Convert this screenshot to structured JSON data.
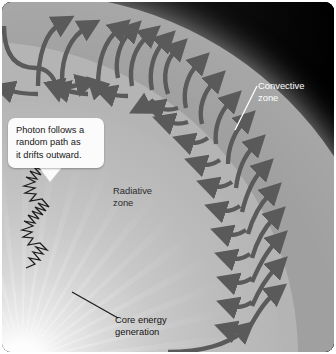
{
  "figure": {
    "background_color": "#000000",
    "frame_corner_radius_px": 9
  },
  "callout": {
    "name": "photon-random-walk-callout",
    "line1": "Photon follows a",
    "line2": "random path as",
    "line3": "it drifts outward.",
    "text": "Photon follows a random path as it drifts outward.",
    "background_color": "#fbfbfb",
    "text_color": "#171717"
  },
  "labels": {
    "convective": {
      "line1": "Convective",
      "line2": "zone",
      "text": "Convective zone",
      "color": "#ffffff",
      "leader": "white line pointing down-left to convective band"
    },
    "radiative": {
      "line1": "Radiative",
      "line2": "zone",
      "text": "Radiative zone",
      "color": "#2b2b2b",
      "leader": "none"
    },
    "core": {
      "line1": "Core energy",
      "line2": "generation",
      "text": "Core energy generation",
      "color": "#111111",
      "leader": "dark line pointing up-left to bright core"
    }
  },
  "zones": [
    {
      "name": "core",
      "label": "Core energy generation",
      "color": "#ffffff",
      "description": "bright white radiating point source at lower left"
    },
    {
      "name": "radiative-zone",
      "label": "Radiative zone",
      "color": "#b4b4b4",
      "description": "light gray interior region where photons random-walk"
    },
    {
      "name": "convective-zone",
      "label": "Convective zone",
      "color": "#a0a0a0",
      "description": "gray outer annulus containing curved convection flow arrows"
    },
    {
      "name": "space",
      "label": "",
      "color": "#000000",
      "description": "black background outside the star limb"
    }
  ],
  "photon_path": {
    "name": "photon-random-walk",
    "stroke_color": "#1c1c1c",
    "arrowhead": "up-right",
    "description": "dense zigzag random walk drifting outward from the core"
  },
  "convection_arrows": {
    "name": "convection-flow-arrows",
    "color": "#5a5a5a",
    "count": 22,
    "description": "curved hook and U-shaped arrows circulating within the convective band"
  }
}
